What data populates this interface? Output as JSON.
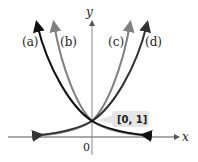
{
  "diagram": {
    "type": "function-graph",
    "axes": {
      "x_label": "x",
      "y_label": "y",
      "origin_label": "0"
    },
    "curves": [
      {
        "label": "(a)",
        "kind": "decreasing exponential (steeper)",
        "color": "#111111"
      },
      {
        "label": "(b)",
        "kind": "decreasing exponential",
        "color": "#808080"
      },
      {
        "label": "(c)",
        "kind": "increasing exponential",
        "color": "#808080"
      },
      {
        "label": "(d)",
        "kind": "increasing exponential (less steep)",
        "color": "#333333"
      }
    ],
    "intersection_point": {
      "label": "[0, 1]",
      "x": 0,
      "y": 1
    },
    "colors": {
      "axis": "#555555",
      "label_box": "#e6e6e6"
    }
  }
}
